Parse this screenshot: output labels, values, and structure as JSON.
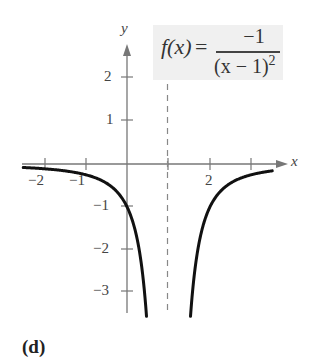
{
  "chart_data": {
    "type": "line",
    "title": "",
    "function_label": {
      "lhs": "f(x)",
      "equals": "=",
      "numerator": "−1",
      "denominator_base": "(x − 1)",
      "denominator_exp": "2"
    },
    "xlabel": "x",
    "ylabel": "y",
    "xlim": [
      -2.5,
      3.9
    ],
    "ylim": [
      -3.5,
      3.0
    ],
    "x_ticks": [
      -2,
      -1,
      1,
      2,
      3
    ],
    "x_tick_labels": [
      {
        "value": -2,
        "label": "−2"
      },
      {
        "value": -1,
        "label": "−1"
      },
      {
        "value": 2,
        "label": "2"
      }
    ],
    "y_ticks": [
      2,
      1,
      -1,
      -2,
      -3
    ],
    "y_tick_labels": [
      {
        "value": 2,
        "label": "2"
      },
      {
        "value": 1,
        "label": "1"
      },
      {
        "value": -1,
        "label": "−1"
      },
      {
        "value": -2,
        "label": "−2"
      },
      {
        "value": -3,
        "label": "−3"
      }
    ],
    "vertical_asymptote": {
      "x": 1,
      "style": "dashed"
    },
    "horizontal_asymptote": {
      "y": 0
    },
    "series": [
      {
        "name": "f(x) = -1/(x-1)^2, left branch",
        "x": [
          -2.5,
          -2,
          -1.5,
          -1,
          -0.5,
          0,
          0.25,
          0.4,
          0.47
        ],
        "y": [
          -0.082,
          -0.111,
          -0.16,
          -0.25,
          -0.444,
          -1.0,
          -1.778,
          -2.778,
          -3.56
        ]
      },
      {
        "name": "f(x) = -1/(x-1)^2, right branch",
        "x": [
          1.53,
          1.6,
          1.75,
          2,
          2.5,
          3,
          3.5
        ],
        "y": [
          -3.56,
          -2.778,
          -1.778,
          -1.0,
          -0.444,
          -0.25,
          -0.16
        ]
      }
    ],
    "grid": false,
    "legend": "none"
  },
  "panel_label": "(d)"
}
